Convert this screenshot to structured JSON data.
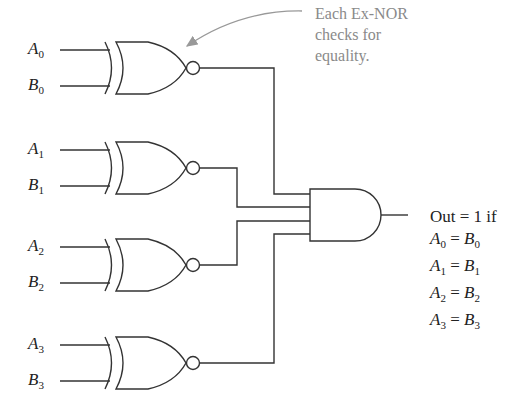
{
  "diagram": {
    "annotation": {
      "line1": "Each Ex-NOR",
      "line2": "checks for",
      "line3": "equality."
    },
    "inputs": [
      {
        "a": "A",
        "a_sub": "0",
        "b": "B",
        "b_sub": "0"
      },
      {
        "a": "A",
        "a_sub": "1",
        "b": "B",
        "b_sub": "1"
      },
      {
        "a": "A",
        "a_sub": "2",
        "b": "B",
        "b_sub": "2"
      },
      {
        "a": "A",
        "a_sub": "3",
        "b": "B",
        "b_sub": "3"
      }
    ],
    "gates": {
      "xnor_count": 4,
      "and_inputs": 4
    },
    "output": {
      "label": "Out = 1 if",
      "conditions": [
        {
          "l": "A",
          "l_sub": "0",
          "op": " = ",
          "r": "B",
          "r_sub": "0"
        },
        {
          "l": "A",
          "l_sub": "1",
          "op": " = ",
          "r": "B",
          "r_sub": "1"
        },
        {
          "l": "A",
          "l_sub": "2",
          "op": " = ",
          "r": "B",
          "r_sub": "2"
        },
        {
          "l": "A",
          "l_sub": "3",
          "op": " = ",
          "r": "B",
          "r_sub": "3"
        }
      ]
    },
    "colors": {
      "line": "#333333",
      "annotation": "#8a8a8a",
      "arrow": "#999999"
    }
  }
}
